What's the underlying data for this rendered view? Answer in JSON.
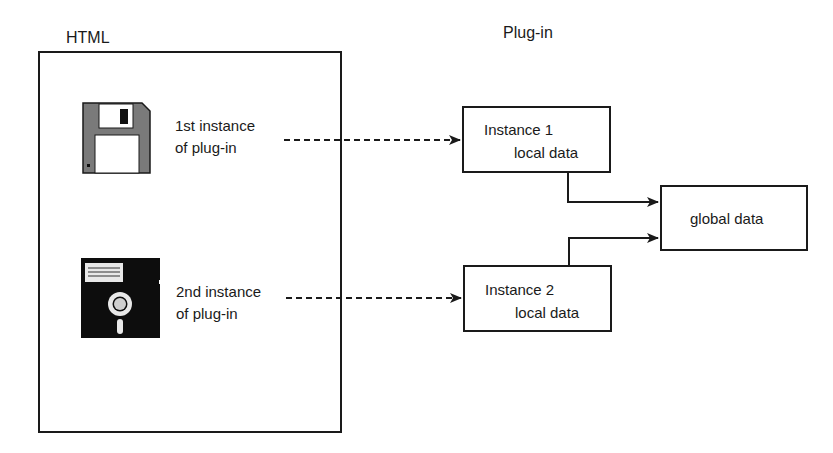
{
  "diagram": {
    "left_group": {
      "title": "HTML",
      "instances": [
        {
          "icon": "floppy-disk-3-5-icon",
          "caption_line1": "1st instance",
          "caption_line2": "of plug-in"
        },
        {
          "icon": "floppy-disk-5-25-icon",
          "caption_line1": "2nd instance",
          "caption_line2": "of plug-in"
        }
      ]
    },
    "right_group": {
      "title": "Plug-in",
      "instance_boxes": [
        {
          "title": "Instance 1",
          "subtitle": "local data"
        },
        {
          "title": "Instance 2",
          "subtitle": "local data"
        }
      ],
      "global_box": {
        "label": "global data"
      }
    },
    "edges": [
      {
        "from": "1st instance of plug-in",
        "to": "Instance 1",
        "style": "dashed"
      },
      {
        "from": "2nd instance of plug-in",
        "to": "Instance 2",
        "style": "dashed"
      },
      {
        "from": "Instance 1",
        "to": "global data",
        "style": "solid"
      },
      {
        "from": "Instance 2",
        "to": "global data",
        "style": "solid"
      }
    ],
    "colors": {
      "stroke": "#1a1a1a",
      "background": "#ffffff",
      "disk_gray": "#7a7a7a"
    }
  }
}
